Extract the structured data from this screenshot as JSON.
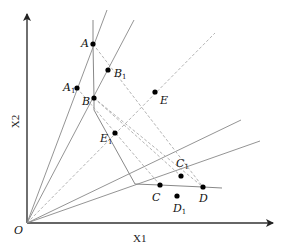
{
  "diagram": {
    "type": "DEA efficiency frontier (input-oriented isoquant)",
    "axes": {
      "x_label": "X1",
      "y_label": "X2",
      "origin_label": "O"
    },
    "points": [
      {
        "id": "A",
        "label": "A",
        "sub": "",
        "x": 93,
        "y": 44
      },
      {
        "id": "B",
        "label": "B",
        "sub": "",
        "x": 94,
        "y": 98
      },
      {
        "id": "A1",
        "label": "A",
        "sub": "1",
        "x": 77,
        "y": 88
      },
      {
        "id": "B1",
        "label": "B",
        "sub": "1",
        "x": 108,
        "y": 70
      },
      {
        "id": "E",
        "label": "E",
        "sub": "",
        "x": 155,
        "y": 92
      },
      {
        "id": "E1",
        "label": "E",
        "sub": "1",
        "x": 115,
        "y": 133
      },
      {
        "id": "C",
        "label": "C",
        "sub": "",
        "x": 160,
        "y": 185
      },
      {
        "id": "C1",
        "label": "C",
        "sub": "1",
        "x": 181,
        "y": 176
      },
      {
        "id": "D",
        "label": "D",
        "sub": "",
        "x": 203,
        "y": 187
      },
      {
        "id": "D1",
        "label": "D",
        "sub": "1",
        "x": 177,
        "y": 196
      }
    ],
    "rays_from_origin": [
      {
        "through": "A1",
        "style": "solid"
      },
      {
        "through": "B1",
        "style": "solid"
      },
      {
        "through": "E",
        "style": "dashed"
      },
      {
        "through": "C1",
        "style": "solid"
      },
      {
        "through": "D1",
        "style": "solid"
      }
    ],
    "frontier": {
      "style": "solid",
      "path": [
        "vertical above A",
        "A",
        "B",
        "kink",
        "C",
        "D",
        "extension"
      ]
    },
    "dashed_connectors": [
      [
        "A",
        "D"
      ],
      [
        "B",
        "C1"
      ],
      [
        "B",
        "D"
      ],
      [
        "A1",
        "C"
      ]
    ]
  }
}
